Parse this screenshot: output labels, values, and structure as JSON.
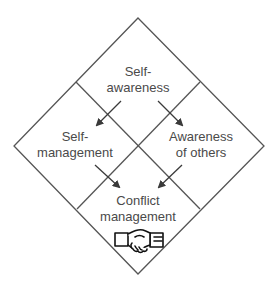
{
  "diagram": {
    "title": "",
    "line_color": "#4a4a4a",
    "text_color": "#4a4a4a",
    "quadrants": [
      {
        "id": "top",
        "line1": "Self-",
        "line2": "awareness"
      },
      {
        "id": "left",
        "line1": "Self-",
        "line2": "management"
      },
      {
        "id": "right",
        "line1": "Awareness",
        "line2": "of others"
      },
      {
        "id": "bottom",
        "line1": "Conflict",
        "line2": "management",
        "icon": "handshake-icon"
      }
    ],
    "arrows": [
      {
        "from": "Self-awareness",
        "to": "Self-management"
      },
      {
        "from": "Self-awareness",
        "to": "Awareness of others"
      },
      {
        "from": "Self-management",
        "to": "Conflict management"
      },
      {
        "from": "Awareness of others",
        "to": "Conflict management"
      }
    ]
  }
}
